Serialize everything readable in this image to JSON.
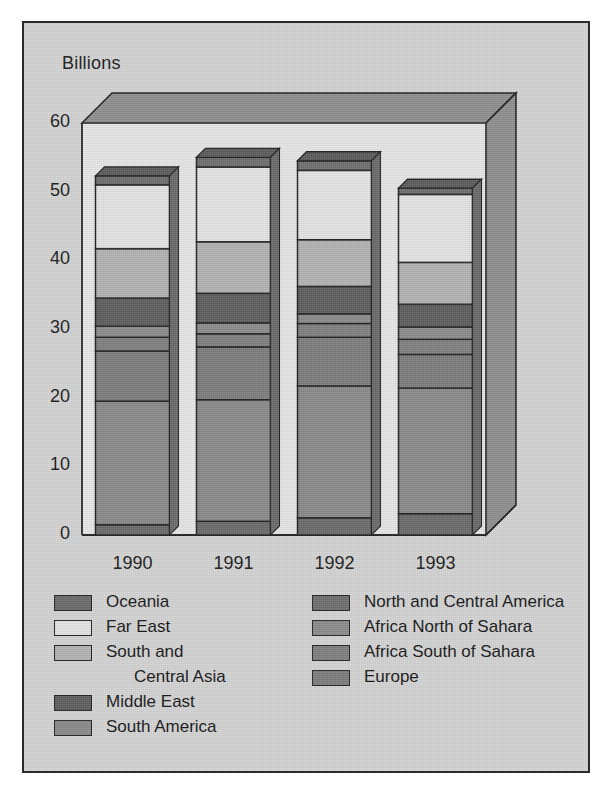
{
  "figure": {
    "axis_title": "Billions",
    "background": "#d4d4d4",
    "border_color": "#2b2b2b"
  },
  "chart_data": {
    "type": "bar",
    "title": "Billions",
    "subtitle": "",
    "xlabel": "",
    "ylabel": "Billions",
    "ylim": [
      0,
      60
    ],
    "yticks": [
      0,
      10,
      20,
      30,
      40,
      50,
      60
    ],
    "grid": false,
    "stacked": true,
    "three_d": true,
    "legend_position": "below",
    "categories": [
      "1990",
      "1991",
      "1992",
      "1993"
    ],
    "series": [
      {
        "name": "Oceania",
        "color": "#6b6b6b",
        "values": [
          1.5,
          2.0,
          2.5,
          3.1
        ]
      },
      {
        "name": "South America",
        "color": "#8a8a8a",
        "values": [
          18.0,
          17.7,
          19.2,
          18.3
        ]
      },
      {
        "name": "Europe",
        "color": "#7d7d7d",
        "values": [
          7.3,
          7.7,
          7.1,
          4.9
        ]
      },
      {
        "name": "Africa South of Sahara",
        "color": "#808080",
        "values": [
          2.0,
          1.9,
          2.0,
          2.2
        ]
      },
      {
        "name": "Africa North of Sahara",
        "color": "#8c8c8c",
        "values": [
          1.6,
          1.6,
          1.4,
          1.8
        ]
      },
      {
        "name": "Middle East",
        "color": "#5e5e5e",
        "values": [
          4.1,
          4.3,
          4.0,
          3.3
        ]
      },
      {
        "name": "South and Central Asia",
        "color": "#b3b3b3",
        "values": [
          7.2,
          7.5,
          6.8,
          6.1
        ]
      },
      {
        "name": "Far East",
        "color": "#e4e4e4",
        "values": [
          9.3,
          10.9,
          10.1,
          9.9
        ]
      },
      {
        "name": "North and Central America",
        "color": "#6f6f6f",
        "values": [
          1.3,
          1.4,
          1.4,
          0.9
        ]
      }
    ],
    "totals": [
      52.3,
      55.0,
      54.5,
      50.5
    ]
  },
  "legend": {
    "left_column": [
      {
        "label": "Oceania",
        "color": "#6b6b6b",
        "continuation": false,
        "indent": false
      },
      {
        "label": "Far East",
        "color": "#e4e4e4",
        "continuation": false,
        "indent": false
      },
      {
        "label": "South and",
        "color": "#b3b3b3",
        "continuation": false,
        "indent": false
      },
      {
        "label": "Central Asia",
        "color": "#b3b3b3",
        "continuation": true,
        "indent": true
      },
      {
        "label": "Middle East",
        "color": "#5e5e5e",
        "continuation": false,
        "indent": false
      },
      {
        "label": "South America",
        "color": "#8a8a8a",
        "continuation": false,
        "indent": false
      }
    ],
    "right_column": [
      {
        "label": "North and Central America",
        "color": "#6f6f6f",
        "continuation": false,
        "indent": false
      },
      {
        "label": "Africa North of Sahara",
        "color": "#8c8c8c",
        "continuation": false,
        "indent": false
      },
      {
        "label": "Africa South of Sahara",
        "color": "#808080",
        "continuation": false,
        "indent": false
      },
      {
        "label": "Europe",
        "color": "#7d7d7d",
        "continuation": false,
        "indent": false
      }
    ]
  }
}
